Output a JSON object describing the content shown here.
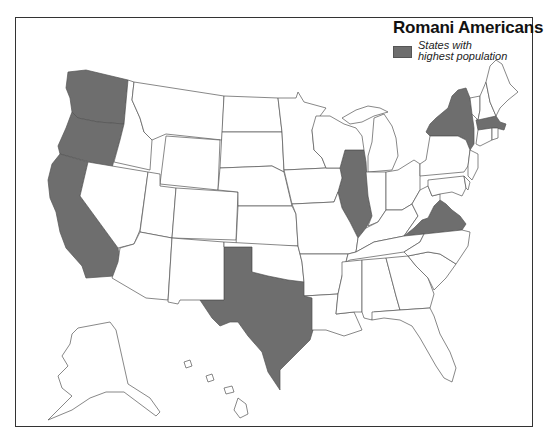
{
  "map": {
    "title": "Romani Americans",
    "legend": {
      "label_line1": "States with",
      "label_line2": "highest population",
      "swatch_color": "#6e6e6e"
    },
    "colors": {
      "highlight": "#6e6e6e",
      "default": "#ffffff",
      "border": "#555555",
      "frame": "#333333"
    },
    "highlighted_states": [
      "Washington",
      "Oregon",
      "California",
      "Texas",
      "Illinois",
      "New York",
      "Massachusetts",
      "Virginia"
    ]
  }
}
